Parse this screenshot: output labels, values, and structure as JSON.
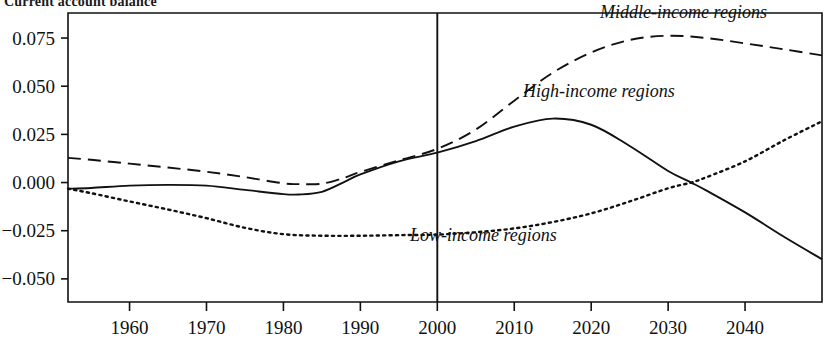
{
  "chart": {
    "title": "Current account balance"
  },
  "chart_data": {
    "type": "line",
    "title": "Current account balance",
    "xlabel": "",
    "ylabel": "",
    "xlim": [
      1952,
      2050
    ],
    "ylim": [
      -0.062,
      0.088
    ],
    "grid": false,
    "legend_position": "inline-annotations",
    "x_ticks": [
      1960,
      1970,
      1980,
      1990,
      2000,
      2010,
      2020,
      2030,
      2040
    ],
    "x_tick_labels": [
      "1960",
      "1970",
      "1980",
      "1990",
      "2000",
      "2010",
      "2020",
      "2030",
      "2040"
    ],
    "y_ticks": [
      0.075,
      0.05,
      0.025,
      0,
      -0.025,
      -0.05
    ],
    "y_tick_labels": [
      "0.075",
      "0.050",
      "0.025",
      "0.000",
      "−0.025",
      "−0.050"
    ],
    "annotations": [
      {
        "text": "Middle-income regions",
        "x": 2032,
        "y": 0.0855
      },
      {
        "text": "High-income regions",
        "x": 2021,
        "y": 0.0445
      },
      {
        "text": "Low-income regions",
        "x": 2006,
        "y": -0.0305
      }
    ],
    "reference_lines": [
      {
        "orientation": "vertical",
        "x": 2000,
        "style": "solid",
        "label": "2000"
      }
    ],
    "series": [
      {
        "name": "Middle-income regions",
        "style": "dashed",
        "color": "#111111",
        "x": [
          1952,
          1955,
          1960,
          1965,
          1970,
          1975,
          1980,
          1982,
          1985,
          1988,
          1990,
          1995,
          2000,
          2005,
          2010,
          2015,
          2020,
          2025,
          2030,
          2035,
          2040,
          2045,
          2050
        ],
        "values": [
          0.0128,
          0.0118,
          0.0098,
          0.0078,
          0.0056,
          0.0028,
          -0.0004,
          -0.0008,
          -0.0006,
          0.0026,
          0.0055,
          0.0115,
          0.0175,
          0.0275,
          0.0425,
          0.057,
          0.0675,
          0.074,
          0.0762,
          0.075,
          0.0722,
          0.0692,
          0.066
        ]
      },
      {
        "name": "High-income regions",
        "style": "solid",
        "color": "#111111",
        "x": [
          1952,
          1955,
          1960,
          1965,
          1970,
          1975,
          1980,
          1982,
          1985,
          1988,
          1990,
          1995,
          2000,
          2005,
          2010,
          2015,
          2020,
          2025,
          2030,
          2033,
          2035,
          2040,
          2045,
          2050
        ],
        "values": [
          -0.0032,
          -0.0028,
          -0.0016,
          -0.0012,
          -0.0016,
          -0.0038,
          -0.006,
          -0.0062,
          -0.0048,
          0.0005,
          0.0042,
          0.011,
          0.0155,
          0.0215,
          0.029,
          0.0332,
          0.03,
          0.019,
          0.006,
          0.0,
          -0.0042,
          -0.0155,
          -0.028,
          -0.0398
        ]
      },
      {
        "name": "Low-income regions",
        "style": "dotted",
        "color": "#111111",
        "x": [
          1952,
          1955,
          1960,
          1965,
          1970,
          1975,
          1980,
          1985,
          1990,
          1995,
          2000,
          2005,
          2010,
          2015,
          2020,
          2025,
          2030,
          2033,
          2035,
          2040,
          2045,
          2050
        ],
        "values": [
          -0.0032,
          -0.0055,
          -0.0098,
          -0.014,
          -0.0185,
          -0.0235,
          -0.0268,
          -0.0276,
          -0.0276,
          -0.0273,
          -0.027,
          -0.0258,
          -0.0238,
          -0.0205,
          -0.016,
          -0.0098,
          -0.003,
          0.0,
          0.0028,
          0.011,
          0.0218,
          0.0318
        ]
      }
    ]
  }
}
